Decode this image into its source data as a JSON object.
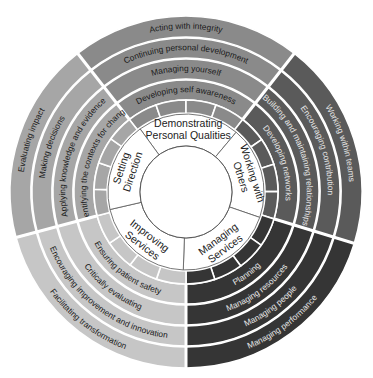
{
  "diagram": {
    "center": {
      "cx": 186,
      "cy": 192
    },
    "radii": {
      "inner_circle": 46,
      "domain_ring_outer": 78,
      "segment_ring_outer": 92,
      "text_rings": [
        [
          92,
          112
        ],
        [
          113,
          133
        ],
        [
          134,
          154
        ],
        [
          155,
          176
        ]
      ]
    },
    "domains": [
      {
        "name": "Demonstrating Personal Qualities",
        "label_lines": [
          "Demonstrating",
          "Personal Qualities"
        ],
        "color": "#8a8a8a",
        "text_color": "#1a1a1a",
        "start_angle": -128,
        "end_angle": -52,
        "elements": [
          "Developing self awareness",
          "Managing yourself",
          "Continuing personal development",
          "Acting with integrity"
        ]
      },
      {
        "name": "Working with Others",
        "label_lines": [
          "Working with",
          "Others"
        ],
        "color": "#5a5a5a",
        "text_color": "#e6e6e6",
        "start_angle": -52,
        "end_angle": 17,
        "elements": [
          "Developing networks",
          "Building and maintaining relationships",
          "Encouraging contribution",
          "Working within teams"
        ]
      },
      {
        "name": "Managing Services",
        "label_lines": [
          "Managing",
          "Services"
        ],
        "color": "#353535",
        "text_color": "#e6e6e6",
        "start_angle": 17,
        "end_angle": 90,
        "elements": [
          "Planning",
          "Managing resources",
          "Managing people",
          "Managing performance"
        ]
      },
      {
        "name": "Improving Services",
        "label_lines": [
          "Improving",
          "Services"
        ],
        "color": "#c6c6c6",
        "text_color": "#1a1a1a",
        "start_angle": 90,
        "end_angle": 165,
        "elements": [
          "Ensuring patient safety",
          "Critically evaluating",
          "Encouraging improvement and innovation",
          "Facilitating transformation"
        ]
      },
      {
        "name": "Setting Direction",
        "label_lines": [
          "Setting",
          "Direction"
        ],
        "color": "#a6a6a6",
        "text_color": "#1a1a1a",
        "start_angle": 165,
        "end_angle": 232,
        "elements": [
          "Identifying the contexts for change",
          "Applying knowledge and evidence",
          "Making decisions",
          "Evaluating impact"
        ]
      }
    ]
  }
}
